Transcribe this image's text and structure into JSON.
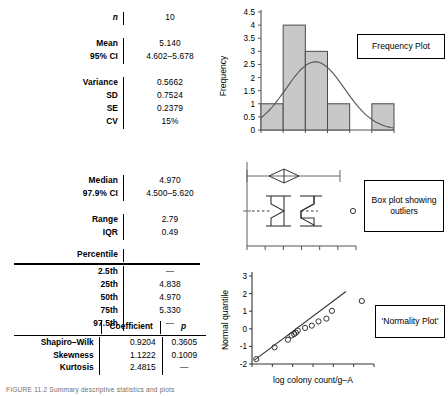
{
  "figure": {
    "caption": "FIGURE 11.2  Summary descriptive statistics and plots"
  },
  "summary_table": {
    "rows": [
      {
        "label": "n",
        "value": "10",
        "italic_label": true
      },
      {
        "label": "Mean",
        "value": "5.140"
      },
      {
        "label": "95% CI",
        "value": "4.602–5.678"
      },
      {
        "label": "Variance",
        "value": "0.5662"
      },
      {
        "label": "SD",
        "value": "0.7524"
      },
      {
        "label": "SE",
        "value": "0.2379"
      },
      {
        "label": "CV",
        "value": "15%"
      },
      {
        "label": "Median",
        "value": "4.970"
      },
      {
        "label": "97.9% CI",
        "value": "4.500–5.620"
      },
      {
        "label": "Range",
        "value": "2.79"
      },
      {
        "label": "IQR",
        "value": "0.49"
      }
    ],
    "percentile_header": "Percentile",
    "percentiles": [
      {
        "label": "2.5th",
        "value": "—"
      },
      {
        "label": "25th",
        "value": "4.838"
      },
      {
        "label": "50th",
        "value": "4.970"
      },
      {
        "label": "75th",
        "value": "5.330"
      },
      {
        "label": "97.5th",
        "value": "—"
      }
    ]
  },
  "coefficient_table": {
    "headers": {
      "name": "",
      "coefficient": "Coefficient",
      "p": "p"
    },
    "rows": [
      {
        "name": "Shapiro–Wilk",
        "coefficient": "0.9204",
        "p": "0.3605"
      },
      {
        "name": "Skewness",
        "coefficient": "1.1222",
        "p": "0.1009"
      },
      {
        "name": "Kurtosis",
        "coefficient": "2.4815",
        "p": "—"
      }
    ]
  },
  "chart_data": [
    {
      "type": "bar",
      "id": "frequency-plot",
      "title": "",
      "tag_label": "Frequency Plot",
      "ylabel": "Frequency",
      "xlabel": "",
      "categories": [
        "1",
        "2",
        "3",
        "4",
        "5",
        "6"
      ],
      "values": [
        1,
        4,
        3,
        1,
        0,
        1
      ],
      "yticks": [
        0,
        0.5,
        1,
        1.5,
        2,
        2.5,
        3,
        3.5,
        4,
        4.5
      ],
      "ytick_labels": [
        "0",
        "0.5",
        "1",
        "1.5",
        "2",
        "2.5",
        "3",
        "3.5",
        "4",
        "4.5"
      ],
      "ylim": [
        0,
        4.5
      ],
      "xtick_labels": [
        "",
        "",
        "",
        "",
        "",
        ""
      ],
      "overlay": "normal-curve",
      "overlay_peak": 2.6,
      "grid": false,
      "legend": "none",
      "bar_fill": "#c8c8c8",
      "bar_stroke": "#4a4a4a"
    },
    {
      "type": "boxplot",
      "id": "box-plot",
      "tag_label": "Box plot showing outliers",
      "ylabel": "",
      "xlabel": "",
      "box": {
        "min": 4.6,
        "q1": 4.838,
        "median": 4.97,
        "q3": 5.33,
        "max": 5.62
      },
      "mean_diamond": {
        "center": 5.14,
        "low": 4.602,
        "high": 5.678
      },
      "outliers": [
        7.2
      ],
      "xticks": 6,
      "grid": false,
      "legend": "none"
    },
    {
      "type": "scatter",
      "id": "normality-plot",
      "tag_label": "'Normality Plot'",
      "ylabel": "Normal quantile",
      "xlabel": "log colony count/g–A",
      "yticks": [
        -2,
        -1,
        0,
        1,
        2,
        3
      ],
      "ytick_labels": [
        "-2",
        "-1",
        "0",
        "1",
        "2",
        "3"
      ],
      "ylim": [
        -2,
        3
      ],
      "xlim": [
        0,
        10
      ],
      "xtick_labels": [
        "",
        "",
        "",
        "",
        "",
        ""
      ],
      "x": [
        0.35,
        1.85,
        2.95,
        3.25,
        3.45,
        3.6,
        3.75,
        4.35,
        4.9,
        5.45,
        6.1,
        6.55,
        9.0
      ],
      "y": [
        -1.72,
        -1.05,
        -0.62,
        -0.38,
        -0.3,
        -0.22,
        -0.1,
        0.05,
        0.18,
        0.42,
        0.58,
        1.02,
        1.58
      ],
      "fit_line": {
        "x0": 0.2,
        "y0": -1.78,
        "x1": 7.7,
        "y1": 2.12
      },
      "grid": false,
      "legend": "none",
      "marker": "open-circle"
    }
  ]
}
